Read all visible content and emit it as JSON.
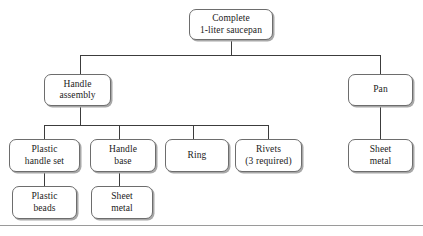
{
  "diagram": {
    "levels": [
      {
        "level": 1,
        "nodes": [
          {
            "id": "complete-saucepan",
            "label": "Complete\n1-liter saucepan",
            "x": 189,
            "y": 9,
            "w": 84,
            "h": 31
          }
        ]
      },
      {
        "level": 2,
        "nodes": [
          {
            "id": "handle-assembly",
            "label": "Handle\nassembly",
            "x": 44,
            "y": 74,
            "w": 67,
            "h": 32
          },
          {
            "id": "pan",
            "label": "Pan",
            "x": 348,
            "y": 74,
            "w": 65,
            "h": 32
          }
        ]
      },
      {
        "level": 3,
        "nodes": [
          {
            "id": "plastic-handle-set",
            "label": "Plastic\nhandle set",
            "x": 9,
            "y": 139,
            "w": 71,
            "h": 33
          },
          {
            "id": "handle-base",
            "label": "Handle\nbase",
            "x": 90,
            "y": 139,
            "w": 66,
            "h": 33
          },
          {
            "id": "ring",
            "label": "Ring",
            "x": 165,
            "y": 139,
            "w": 64,
            "h": 33
          },
          {
            "id": "rivets",
            "label": "Rivets\n(3 required)",
            "x": 235,
            "y": 139,
            "w": 67,
            "h": 33
          },
          {
            "id": "pan-sheet-metal",
            "label": "Sheet\nmetal",
            "x": 348,
            "y": 139,
            "w": 65,
            "h": 33
          }
        ]
      },
      {
        "level": 4,
        "nodes": [
          {
            "id": "plastic-beads",
            "label": "Plastic\nbeads",
            "x": 12,
            "y": 186,
            "w": 65,
            "h": 33
          },
          {
            "id": "handle-sheet-metal",
            "label": "Sheet\nmetal",
            "x": 91,
            "y": 186,
            "w": 62,
            "h": 33
          }
        ]
      }
    ],
    "connectors": {
      "stroke_color": "#3c3c3c",
      "stroke_width": 1
    },
    "footer_rule": {
      "y": 225,
      "color": "#9a9a9a"
    },
    "colors": {
      "box_border": "#6d6d6d",
      "box_fill": "#ffffff",
      "box_shadow": "#a8a8a8",
      "text": "#1a1a1a",
      "background": "#ffffff"
    }
  }
}
